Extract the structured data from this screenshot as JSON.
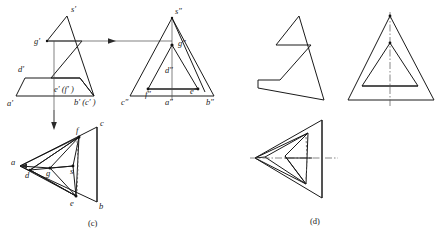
{
  "figure": {
    "captions": [
      {
        "id": "caption-c",
        "text": "(c)",
        "x": 97,
        "y": 224
      },
      {
        "id": "caption-d",
        "text": "(d)",
        "x": 318,
        "y": 221
      }
    ],
    "colors": {
      "line": "#1a1a1a",
      "thin_line": "#3a3a3a",
      "dashed": "#5a5a5a",
      "center_line": "#555555",
      "background": "#ffffff",
      "label": "#1a1a1a"
    },
    "views": {
      "front_view": {
        "name": "front-view",
        "labels": [
          {
            "id": "label-s-prime",
            "text": "s′",
            "x": 71,
            "y": 12
          },
          {
            "id": "label-g-prime",
            "text": "g′",
            "x": 36,
            "y": 41
          },
          {
            "id": "label-d-prime",
            "text": "d′",
            "x": 20,
            "y": 70
          },
          {
            "id": "label-ef-prime",
            "text": "e′ (f′ )",
            "x": 57,
            "y": 90
          },
          {
            "id": "label-a-prime",
            "text": "a′",
            "x": 9,
            "y": 104
          },
          {
            "id": "label-bc-prime",
            "text": "b′ (c′ )",
            "x": 77,
            "y": 103
          }
        ]
      },
      "side_view": {
        "name": "side-view",
        "labels": [
          {
            "id": "label-s-dprime",
            "text": "s″",
            "x": 176,
            "y": 12
          },
          {
            "id": "label-g-dprime",
            "text": "g″",
            "x": 180,
            "y": 44
          },
          {
            "id": "label-d-dprime",
            "text": "d″",
            "x": 168,
            "y": 71
          },
          {
            "id": "label-f-dprime",
            "text": "f″",
            "x": 147,
            "y": 95
          },
          {
            "id": "label-e-dprime",
            "text": "e″",
            "x": 192,
            "y": 92
          },
          {
            "id": "label-c-dprime",
            "text": "c″",
            "x": 124,
            "y": 104
          },
          {
            "id": "label-a-dprime",
            "text": "a″",
            "x": 167,
            "y": 104
          },
          {
            "id": "label-b-dprime",
            "text": "b″",
            "x": 208,
            "y": 103
          }
        ]
      },
      "pictorial_view": {
        "name": "pictorial-view-c",
        "labels": [
          {
            "id": "label-c",
            "text": "c",
            "x": 100,
            "y": 123
          },
          {
            "id": "label-f",
            "text": "f",
            "x": 77,
            "y": 131
          },
          {
            "id": "label-a",
            "text": "a",
            "x": 13,
            "y": 163
          },
          {
            "id": "label-d",
            "text": "d",
            "x": 27,
            "y": 172
          },
          {
            "id": "label-g",
            "text": "g",
            "x": 48,
            "y": 165
          },
          {
            "id": "label-s",
            "text": "s",
            "x": 72,
            "y": 162
          },
          {
            "id": "label-e",
            "text": "e",
            "x": 72,
            "y": 203
          },
          {
            "id": "label-b",
            "text": "b",
            "x": 100,
            "y": 207
          }
        ]
      },
      "solution_views": {
        "name": "solution-views-d",
        "labels": []
      }
    }
  }
}
